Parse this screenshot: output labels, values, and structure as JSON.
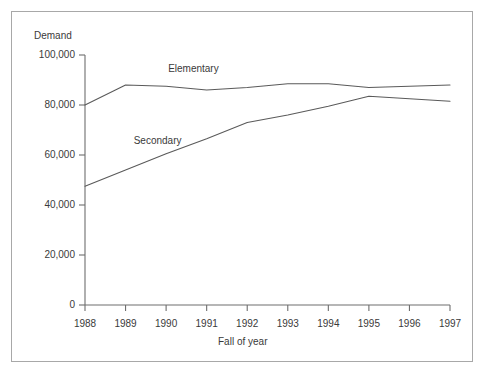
{
  "chart_data": {
    "type": "line",
    "title": "",
    "xlabel": "Fall of year",
    "ylabel": "Demand",
    "x": [
      1988,
      1989,
      1990,
      1991,
      1992,
      1993,
      1994,
      1995,
      1996,
      1997
    ],
    "categories": [
      "1988",
      "1989",
      "1990",
      "1991",
      "1992",
      "1993",
      "1994",
      "1995",
      "1996",
      "1997"
    ],
    "series": [
      {
        "name": "Elementary",
        "values": [
          80000,
          88000,
          87500,
          86000,
          87000,
          88500,
          88500,
          87000,
          87500,
          88000
        ]
      },
      {
        "name": "Secondary",
        "values": [
          47500,
          54000,
          60500,
          66500,
          73000,
          76000,
          79500,
          83500,
          82500,
          81500
        ]
      }
    ],
    "xlim": [
      1988,
      1997
    ],
    "ylim": [
      0,
      100000
    ],
    "ytick_values": [
      0,
      20000,
      40000,
      60000,
      80000,
      100000
    ],
    "ytick_labels": [
      "0",
      "20,000",
      "40,000",
      "60,000",
      "80,000",
      "100,000"
    ],
    "xtick_labels": [
      "1988",
      "1989",
      "1990",
      "1991",
      "1992",
      "1993",
      "1994",
      "1995",
      "1996",
      "1997"
    ],
    "grid": false,
    "legend": "inline-annotations",
    "annotations": [
      {
        "text": "Elementary",
        "x": 1990.05,
        "y": 94500
      },
      {
        "text": "Secondary",
        "x": 1989.2,
        "y": 65500
      }
    ],
    "colors": {
      "line": "#5a5a5a",
      "axis": "#6e6e6e",
      "text": "#3a3a3a",
      "frame": "#a8a8a8",
      "background": "#ffffff"
    }
  }
}
